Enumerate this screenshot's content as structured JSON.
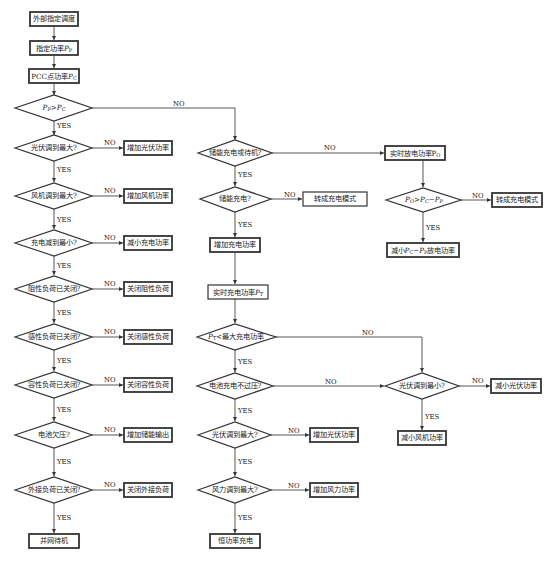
{
  "diagram": {
    "labels": {
      "yes": "YES",
      "no": "NO"
    },
    "left_column": {
      "start": "外部指定调度",
      "set_power_prefix": "指定功率",
      "set_power_var": "P",
      "set_power_sub": "P",
      "pcc_prefix": "PCC点功率",
      "pcc_var": "P",
      "pcc_sub": "C",
      "decision_main": {
        "lhs": "P",
        "lhs_sub": "P",
        "op": ">",
        "rhs": "P",
        "rhs_sub": "C"
      },
      "decisions": [
        {
          "q": "光伏调到最大?",
          "no_action": "增加光伏功率"
        },
        {
          "q": "风机调到最大?",
          "no_action": "增加风机功率"
        },
        {
          "q": "充电减到最小?",
          "no_action": "减小充电功率"
        },
        {
          "q": "阻性负荷已关闭?",
          "no_action": "关闭阻性负荷"
        },
        {
          "q": "感性负荷已关闭?",
          "no_action": "关闭感性负荷"
        },
        {
          "q": "容性负荷已关闭?",
          "no_action": "关闭容性负荷"
        },
        {
          "q": "电池欠压?",
          "no_action": "增加储能输出"
        },
        {
          "q": "外接负荷已关闭?",
          "no_action": "关闭外接负荷"
        }
      ],
      "end": "并网待机"
    },
    "middle_column": {
      "decision_storage": "储能充电或待机?",
      "decision_charging": "储能充电?",
      "charging_no_action": "转成充电模式",
      "increase_charge": "增加充电功率",
      "realtime_charge_prefix": "实时充电功率",
      "realtime_charge_var": "P",
      "realtime_charge_sub": "T",
      "decision_max_charge": {
        "lhs": "P",
        "lhs_sub": "T",
        "text": "<最大充电功率"
      },
      "decision_overvoltage": "电池充电不过压?",
      "decision_pv_max": "光伏调到最大?",
      "pv_max_no_action": "增加光伏功率",
      "decision_wind_max": "风力调到最大?",
      "wind_max_no_action": "增加风力功率",
      "end": "恒功率充电"
    },
    "right_column": {
      "realtime_discharge_prefix": "实时放电功率",
      "realtime_discharge_var": "P",
      "realtime_discharge_sub": "O",
      "decision_discharge": {
        "a": "P",
        "a_sub": "O",
        "b": "P",
        "b_sub": "C",
        "c": "P",
        "c_sub": "P"
      },
      "discharge_no_action": "转成充电模式",
      "discharge_yes_prefix": "减小",
      "discharge_yes_suffix": "放电功率",
      "decision_pv_min": "光伏调到最小?",
      "pv_min_no_action": "减小光伏功率",
      "pv_min_yes_action": "减小风机功率"
    }
  }
}
